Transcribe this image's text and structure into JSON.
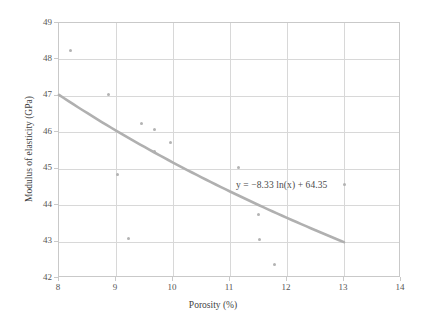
{
  "chart_data": {
    "type": "scatter",
    "title": "",
    "xlabel": "Porosity (%)",
    "ylabel": "Modulus of elasticity (GPa)",
    "xlim": [
      8,
      14
    ],
    "ylim": [
      42,
      49
    ],
    "xticks": [
      8,
      9,
      10,
      11,
      12,
      13,
      14
    ],
    "yticks": [
      42,
      43,
      44,
      45,
      46,
      47,
      48,
      49
    ],
    "xtick_labels": [
      "8",
      "9",
      "10",
      "11",
      "12",
      "13",
      "14"
    ],
    "ytick_labels": [
      "42",
      "43",
      "44",
      "45",
      "46",
      "47",
      "48",
      "49"
    ],
    "grid": true,
    "legend": "none",
    "points": [
      {
        "x": 8.2,
        "y": 48.25
      },
      {
        "x": 8.87,
        "y": 47.03
      },
      {
        "x": 9.03,
        "y": 44.83
      },
      {
        "x": 9.22,
        "y": 43.08
      },
      {
        "x": 9.45,
        "y": 46.25
      },
      {
        "x": 9.68,
        "y": 46.07
      },
      {
        "x": 9.68,
        "y": 45.48
      },
      {
        "x": 9.95,
        "y": 45.72
      },
      {
        "x": 11.15,
        "y": 45.03
      },
      {
        "x": 11.5,
        "y": 43.75
      },
      {
        "x": 11.52,
        "y": 43.05
      },
      {
        "x": 11.78,
        "y": 42.37
      },
      {
        "x": 13.0,
        "y": 44.58
      }
    ],
    "trendline": {
      "type": "logarithmic",
      "equation": "y = −8.33 ln(x) + 64.35",
      "slope": -8.33,
      "intercept": 64.35,
      "x_start": 8.0,
      "x_end": 13.0,
      "y_start": 46.82,
      "y_end": 42.97
    },
    "annotations": [
      {
        "text": "y = −8.33 ln(x) + 64.35",
        "x": 12.1,
        "y": 43.85
      }
    ],
    "colors": {
      "marker": "#b3b3b3",
      "trendline": "#b0b0b0",
      "gridline": "#d8d8d8",
      "axis": "#c9c9c9",
      "text": "#4a4a4a",
      "background": "#ffffff"
    }
  },
  "axis": {
    "x_title": "Porosity (%)",
    "y_title": "Modulus of elasticity (GPa)"
  },
  "equation": {
    "text": "y = −8.33 ln(x) + 64.35"
  }
}
